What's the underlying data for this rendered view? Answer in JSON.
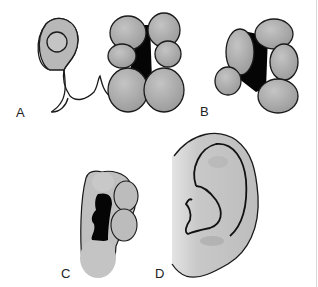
{
  "figure": {
    "panels": [
      {
        "id": "A",
        "label": "A",
        "description": "Pharyngeal arch with six auricular hillocks"
      },
      {
        "id": "B",
        "label": "B",
        "description": "Fusing auricular hillocks"
      },
      {
        "id": "C",
        "label": "C",
        "description": "Developing auricle"
      },
      {
        "id": "D",
        "label": "D",
        "description": "Adult auricle"
      }
    ]
  },
  "colors": {
    "fill": "#b4b4b4",
    "fill_light": "#c8c8c8",
    "outline": "#1a1a1a",
    "cavity": "#050505",
    "background": "#ffffff"
  }
}
